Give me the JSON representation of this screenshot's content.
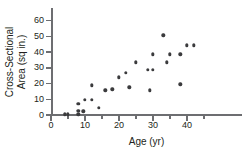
{
  "chart_data": {
    "type": "scatter",
    "title": "",
    "xlabel": "Age (yr)",
    "ylabel": "Cross-Sectional Area (sq in.)",
    "ylabel_line1": "Cross-Sectional",
    "ylabel_line2": "Area (sq in.)",
    "xlim": [
      0,
      46
    ],
    "ylim": [
      0,
      63
    ],
    "xticks": [
      0,
      10,
      20,
      30,
      40
    ],
    "xticks_minor": [
      5,
      15,
      25,
      35,
      45
    ],
    "yticks": [
      0,
      10,
      20,
      30,
      40,
      50,
      60
    ],
    "grid": false,
    "legend": "none",
    "marker_color": "#3b3b3d",
    "axis_color": "#6d6e71",
    "points": [
      {
        "x": 4,
        "y": 0.4
      },
      {
        "x": 5,
        "y": 0.4
      },
      {
        "x": 8,
        "y": 0.5
      },
      {
        "x": 8,
        "y": 2.6
      },
      {
        "x": 8,
        "y": 7.0
      },
      {
        "x": 9.5,
        "y": 2.4
      },
      {
        "x": 10,
        "y": 9.8
      },
      {
        "x": 12,
        "y": 9.6
      },
      {
        "x": 12,
        "y": 19.0
      },
      {
        "x": 14,
        "y": 4.6
      },
      {
        "x": 16,
        "y": 15.6
      },
      {
        "x": 18,
        "y": 16.4
      },
      {
        "x": 20,
        "y": 24.0
      },
      {
        "x": 22,
        "y": 26.8
      },
      {
        "x": 23,
        "y": 17.6
      },
      {
        "x": 25,
        "y": 33.4
      },
      {
        "x": 28.5,
        "y": 28.6
      },
      {
        "x": 29,
        "y": 15.6
      },
      {
        "x": 30,
        "y": 28.6
      },
      {
        "x": 30,
        "y": 38.6
      },
      {
        "x": 33,
        "y": 50.8
      },
      {
        "x": 34,
        "y": 33.4
      },
      {
        "x": 35,
        "y": 38.6
      },
      {
        "x": 38,
        "y": 19.6
      },
      {
        "x": 38,
        "y": 38.6
      },
      {
        "x": 40,
        "y": 44.4
      },
      {
        "x": 42,
        "y": 44.4
      }
    ]
  }
}
